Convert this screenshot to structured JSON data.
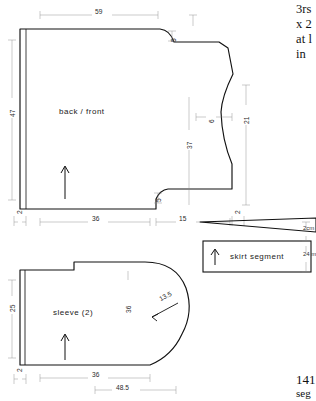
{
  "page": {
    "background": "#ffffff",
    "ink": "#1a1a1a"
  },
  "printed_text": {
    "top_lines": [
      "3rs",
      "x 2",
      "at l",
      "in "
    ],
    "bottom_number": "141",
    "bottom_word": "seg"
  },
  "pieces": [
    {
      "id": "back-front",
      "label": "back / front",
      "grainline": "up-arrow",
      "dimensions": [
        {
          "name": "top-width",
          "value": "59"
        },
        {
          "name": "left-height",
          "value": "47"
        },
        {
          "name": "bottom-width",
          "value": "36"
        },
        {
          "name": "hem-allowance",
          "value": "2"
        },
        {
          "name": "shoulder-drop",
          "value": "5"
        },
        {
          "name": "center-height",
          "value": "37"
        },
        {
          "name": "armhole-depth",
          "value": "6"
        },
        {
          "name": "side-height",
          "value": "21"
        },
        {
          "name": "side-step",
          "value": "15"
        },
        {
          "name": "side-allowance",
          "value": "2"
        },
        {
          "name": "hem-step",
          "value": "5"
        }
      ]
    },
    {
      "id": "sleeve",
      "label": "sleeve  (2)",
      "grainline": "up-arrow",
      "dimensions": [
        {
          "name": "left-height",
          "value": "25"
        },
        {
          "name": "center-height",
          "value": "36"
        },
        {
          "name": "cap-measure",
          "value": "13.5"
        },
        {
          "name": "bottom-width",
          "value": "36"
        },
        {
          "name": "total-width",
          "value": "48.5"
        },
        {
          "name": "hem-allowance",
          "value": "2"
        }
      ]
    },
    {
      "id": "skirt-segment",
      "label": "skirt segment",
      "grainline": "up-arrow",
      "dimensions": [
        {
          "name": "wedge-height",
          "value": "2cm"
        },
        {
          "name": "panel-height",
          "value": "24 m"
        }
      ]
    }
  ]
}
